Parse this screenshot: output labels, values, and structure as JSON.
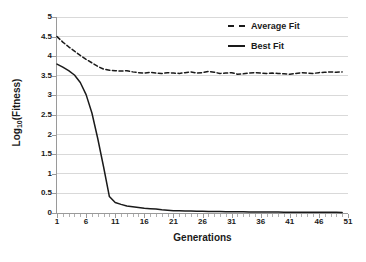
{
  "chart_data": {
    "type": "line",
    "title": "",
    "xlabel": "Generations",
    "ylabel": "Log10(Fitness)",
    "ylabel_base": "Log",
    "ylabel_sub": "10",
    "ylabel_tail": "(Fitness)",
    "xlim": [
      1,
      51
    ],
    "ylim": [
      0,
      5
    ],
    "grid": true,
    "grid_axis": "y",
    "legend_position": "top-right",
    "xticks": [
      1,
      6,
      11,
      16,
      21,
      26,
      31,
      36,
      41,
      46,
      51
    ],
    "xtick_labels": [
      "1",
      "6",
      "11",
      "16",
      "21",
      "26",
      "31",
      "36",
      "41",
      "46",
      "51"
    ],
    "xtick_minor_step": 1,
    "yticks": [
      0,
      0.5,
      1,
      1.5,
      2,
      2.5,
      3,
      3.5,
      4,
      4.5,
      5
    ],
    "ytick_labels": [
      "0",
      "0.5",
      "1",
      "1.5",
      "2",
      "2.5",
      "3",
      "3.5",
      "4",
      "4.5",
      "5"
    ],
    "x": [
      1,
      2,
      3,
      4,
      5,
      6,
      7,
      8,
      9,
      10,
      11,
      12,
      13,
      14,
      15,
      16,
      17,
      18,
      19,
      20,
      21,
      22,
      23,
      24,
      25,
      26,
      27,
      28,
      29,
      30,
      31,
      32,
      33,
      34,
      35,
      36,
      37,
      38,
      39,
      40,
      41,
      42,
      43,
      44,
      45,
      46,
      47,
      48,
      49,
      50
    ],
    "series": [
      {
        "name": "Average Fit",
        "style": "dashed",
        "color": "#1a1a1a",
        "values": [
          4.5,
          4.36,
          4.24,
          4.13,
          4.02,
          3.92,
          3.83,
          3.74,
          3.67,
          3.64,
          3.63,
          3.62,
          3.63,
          3.6,
          3.58,
          3.57,
          3.59,
          3.57,
          3.56,
          3.58,
          3.57,
          3.56,
          3.58,
          3.6,
          3.57,
          3.58,
          3.61,
          3.59,
          3.56,
          3.57,
          3.58,
          3.54,
          3.55,
          3.57,
          3.58,
          3.57,
          3.56,
          3.57,
          3.56,
          3.55,
          3.54,
          3.56,
          3.58,
          3.57,
          3.56,
          3.58,
          3.59,
          3.6,
          3.59,
          3.6
        ]
      },
      {
        "name": "Best Fit",
        "style": "solid",
        "color": "#1a1a1a",
        "values": [
          3.8,
          3.72,
          3.63,
          3.52,
          3.33,
          3.02,
          2.55,
          1.9,
          1.18,
          0.42,
          0.27,
          0.22,
          0.18,
          0.16,
          0.14,
          0.12,
          0.11,
          0.1,
          0.08,
          0.07,
          0.06,
          0.055,
          0.05,
          0.048,
          0.045,
          0.042,
          0.04,
          0.038,
          0.036,
          0.034,
          0.032,
          0.03,
          0.029,
          0.028,
          0.027,
          0.026,
          0.025,
          0.024,
          0.023,
          0.022,
          0.021,
          0.02,
          0.02,
          0.019,
          0.018,
          0.018,
          0.017,
          0.016,
          0.016,
          0.015
        ]
      }
    ]
  },
  "legend": {
    "entries": [
      {
        "label": "Average Fit"
      },
      {
        "label": "Best Fit"
      }
    ]
  },
  "colors": {
    "line": "#1a1a1a",
    "grid": "#d9d9d9",
    "axis": "#9a9a9a",
    "background": "#ffffff"
  }
}
